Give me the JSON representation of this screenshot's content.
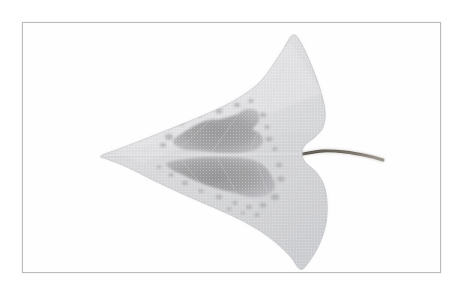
{
  "figure": {
    "kind": "specimen-photograph",
    "subject": "leaf",
    "title": "",
    "caption": "",
    "background_color": "#ffffff"
  },
  "plate": {
    "frame_color": "#b9bbbd",
    "frame_shadow_color": "#c6c8ca",
    "fill_color": "#fefefe",
    "x": 22,
    "y": 22,
    "width": 419,
    "height": 251
  },
  "specimen": {
    "name": "leaf-specimen",
    "description": "triangular hastate leaf with two basal lobes and a slender petiole",
    "orientation": "petiole pointing right",
    "lamina_color": "#dcdcde",
    "lamina_shadow_color": "#cfd0d2",
    "lamina_highlight_color": "#e8e8ea",
    "lamina_edge_color": "#bfc0c2",
    "midrib_color": "#e9e9eb",
    "vein_color": "#d2d3d5",
    "petiole_color": "#5a554f",
    "petiole_highlight_color": "#8e8981",
    "lesion_color": "#a3a3a5",
    "lesion_core_color": "#949496",
    "lesion_edge_color": "#b6b6b8",
    "speck_color": "#acacae",
    "outline": [
      [
        78,
        133
      ],
      [
        96,
        126
      ],
      [
        122,
        116
      ],
      [
        152,
        104
      ],
      [
        186,
        90
      ],
      [
        214,
        76
      ],
      [
        238,
        58
      ],
      [
        258,
        30
      ],
      [
        270,
        12
      ],
      [
        279,
        22
      ],
      [
        289,
        44
      ],
      [
        297,
        66
      ],
      [
        302,
        88
      ],
      [
        300,
        104
      ],
      [
        292,
        114
      ],
      [
        282,
        122
      ],
      [
        279,
        130
      ],
      [
        282,
        139
      ],
      [
        292,
        148
      ],
      [
        300,
        160
      ],
      [
        304,
        178
      ],
      [
        303,
        200
      ],
      [
        296,
        222
      ],
      [
        285,
        240
      ],
      [
        277,
        246
      ],
      [
        266,
        232
      ],
      [
        246,
        214
      ],
      [
        220,
        198
      ],
      [
        192,
        185
      ],
      [
        162,
        172
      ],
      [
        132,
        158
      ],
      [
        104,
        144
      ],
      [
        84,
        136
      ]
    ],
    "midrib": {
      "x1": 84,
      "y1": 132,
      "x2": 278,
      "y2": 131
    },
    "petiole": [
      [
        279,
        131
      ],
      [
        300,
        128
      ],
      [
        322,
        129
      ],
      [
        345,
        133
      ],
      [
        360,
        137
      ]
    ],
    "lesions": [
      {
        "name": "upper-lesion",
        "points": [
          [
            150,
            118
          ],
          [
            166,
            106
          ],
          [
            182,
            98
          ],
          [
            198,
            96
          ],
          [
            212,
            92
          ],
          [
            224,
            86
          ],
          [
            234,
            88
          ],
          [
            236,
            98
          ],
          [
            230,
            106
          ],
          [
            236,
            110
          ],
          [
            240,
            118
          ],
          [
            234,
            126
          ],
          [
            218,
            130
          ],
          [
            198,
            130
          ],
          [
            178,
            128
          ],
          [
            160,
            126
          ]
        ]
      },
      {
        "name": "lower-lesion",
        "points": [
          [
            144,
            140
          ],
          [
            162,
            136
          ],
          [
            184,
            134
          ],
          [
            206,
            134
          ],
          [
            226,
            136
          ],
          [
            240,
            142
          ],
          [
            248,
            152
          ],
          [
            252,
            164
          ],
          [
            244,
            172
          ],
          [
            228,
            174
          ],
          [
            212,
            170
          ],
          [
            196,
            166
          ],
          [
            178,
            160
          ],
          [
            160,
            152
          ],
          [
            148,
            146
          ]
        ]
      }
    ],
    "lesion_specks": [
      {
        "cx": 146,
        "cy": 114,
        "r": 3.0
      },
      {
        "cx": 140,
        "cy": 122,
        "r": 2.2
      },
      {
        "cx": 158,
        "cy": 100,
        "r": 2.4
      },
      {
        "cx": 176,
        "cy": 92,
        "r": 2.0
      },
      {
        "cx": 196,
        "cy": 88,
        "r": 2.6
      },
      {
        "cx": 214,
        "cy": 82,
        "r": 2.2
      },
      {
        "cx": 228,
        "cy": 78,
        "r": 2.0
      },
      {
        "cx": 240,
        "cy": 92,
        "r": 2.4
      },
      {
        "cx": 244,
        "cy": 104,
        "r": 2.0
      },
      {
        "cx": 246,
        "cy": 116,
        "r": 2.6
      },
      {
        "cx": 252,
        "cy": 126,
        "r": 2.0
      },
      {
        "cx": 256,
        "cy": 142,
        "r": 2.4
      },
      {
        "cx": 258,
        "cy": 156,
        "r": 2.8
      },
      {
        "cx": 252,
        "cy": 174,
        "r": 3.0
      },
      {
        "cx": 240,
        "cy": 182,
        "r": 2.6
      },
      {
        "cx": 226,
        "cy": 184,
        "r": 2.2
      },
      {
        "cx": 212,
        "cy": 180,
        "r": 2.0
      },
      {
        "cx": 196,
        "cy": 174,
        "r": 2.4
      },
      {
        "cx": 178,
        "cy": 168,
        "r": 2.0
      },
      {
        "cx": 162,
        "cy": 160,
        "r": 2.2
      },
      {
        "cx": 148,
        "cy": 152,
        "r": 2.0
      },
      {
        "cx": 136,
        "cy": 144,
        "r": 1.8
      },
      {
        "cx": 206,
        "cy": 186,
        "r": 1.8
      },
      {
        "cx": 234,
        "cy": 192,
        "r": 2.0
      },
      {
        "cx": 220,
        "cy": 190,
        "r": 1.6
      },
      {
        "cx": 190,
        "cy": 98,
        "r": 1.6
      },
      {
        "cx": 168,
        "cy": 110,
        "r": 1.8
      }
    ]
  }
}
